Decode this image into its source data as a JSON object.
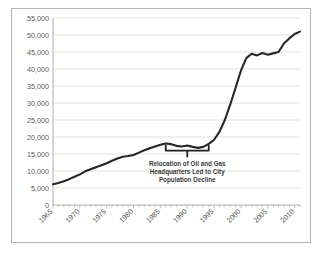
{
  "chart_data": {
    "type": "line",
    "title": "",
    "subtitle": "",
    "xlabel": "",
    "ylabel": "",
    "xlim": [
      1965,
      2011
    ],
    "ylim": [
      0,
      55000
    ],
    "grid": true,
    "legend": false,
    "legend_position": "none",
    "line_color": "#262626",
    "grid_color": "#d9d9d9",
    "axis_color": "#a6a6a6",
    "background_color": "#ffffff",
    "y_ticks": [
      0,
      5000,
      10000,
      15000,
      20000,
      25000,
      30000,
      35000,
      40000,
      45000,
      50000,
      55000
    ],
    "y_tick_labels": [
      "0",
      "5,000",
      "10,000",
      "15,000",
      "20,000",
      "25,000",
      "30,000",
      "35,000",
      "40,000",
      "45,000",
      "50,000",
      "55,000"
    ],
    "x_ticks": [
      1965,
      1970,
      1975,
      1980,
      1985,
      1990,
      1995,
      2000,
      2005,
      2010
    ],
    "x_tick_labels": [
      "1965",
      "1970",
      "1975",
      "1980",
      "1985",
      "1990",
      "1995",
      "2000",
      "2005",
      "2010"
    ],
    "x_minor_tick_interval": 1,
    "series": [
      {
        "name": "Population",
        "color": "#262626",
        "x": [
          1965,
          1966,
          1967,
          1968,
          1969,
          1970,
          1971,
          1972,
          1973,
          1974,
          1975,
          1976,
          1977,
          1978,
          1979,
          1980,
          1981,
          1982,
          1983,
          1984,
          1985,
          1986,
          1987,
          1988,
          1989,
          1990,
          1991,
          1992,
          1993,
          1994,
          1995,
          1996,
          1997,
          1998,
          1999,
          2000,
          2001,
          2002,
          2003,
          2004,
          2005,
          2006,
          2007,
          2008,
          2009,
          2010,
          2011
        ],
        "values": [
          6100,
          6500,
          7000,
          7600,
          8300,
          9000,
          9900,
          10500,
          11100,
          11700,
          12300,
          13000,
          13700,
          14200,
          14400,
          14700,
          15400,
          16100,
          16700,
          17200,
          17700,
          18100,
          17900,
          17400,
          17200,
          17500,
          17100,
          16800,
          17100,
          18000,
          19200,
          21500,
          25000,
          29500,
          34500,
          39500,
          43200,
          44500,
          44000,
          44700,
          44200,
          44600,
          45000,
          47500,
          49000,
          50300,
          51000
        ]
      }
    ],
    "annotations": [
      {
        "name": "relocation-note",
        "text_lines": [
          "Relocation of Oil and Gas",
          "Headquarters Led to City",
          "Population Decline"
        ],
        "bracket_x_start": 1986,
        "bracket_x_end": 1994,
        "bracket_y": 16000,
        "text_color": "#3a3a3a"
      }
    ]
  }
}
